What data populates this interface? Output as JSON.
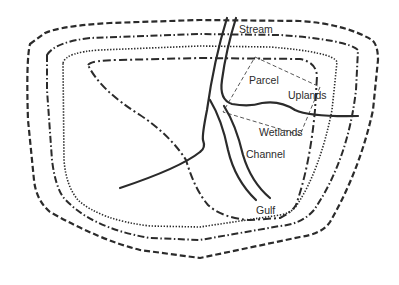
{
  "diagram": {
    "labels": {
      "stream": "Stream",
      "parcel": "Parcel",
      "uplands": "Uplands",
      "wetlands": "Wetlands",
      "channel": "Channel",
      "gulf": "Gulf"
    },
    "contours": [
      {
        "name": "outer",
        "style": "dashed"
      },
      {
        "name": "second",
        "style": "dash-dot"
      },
      {
        "name": "third",
        "style": "dotted"
      },
      {
        "name": "inner",
        "style": "dash-dot"
      }
    ],
    "colors": {
      "line": "#2b2b2b",
      "background": "#ffffff"
    }
  }
}
